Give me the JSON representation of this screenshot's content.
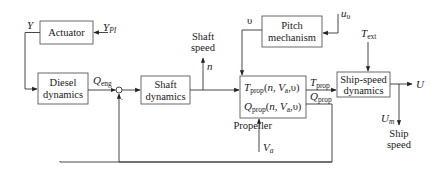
{
  "diagram": {
    "blocks": {
      "actuator": {
        "label": "Actuator"
      },
      "diesel": {
        "line1": "Diesel",
        "line2": "dynamics"
      },
      "shaft": {
        "line1": "Shaft",
        "line2": "dynamics"
      },
      "propeller": {
        "label": "Propeller",
        "thrust_fn": {
          "sym": "T",
          "sub": "prop",
          "args_pre": "(",
          "n": "n",
          "sep1": ", ",
          "va": "V",
          "va_sub": "a",
          "sep2": ",",
          "u": "υ",
          "close": ")"
        },
        "torque_fn": {
          "sym": "Q",
          "sub": "prop",
          "args_pre": "(",
          "n": "n",
          "sep1": ", ",
          "va": "V",
          "va_sub": "a",
          "sep2": ",",
          "u": "υ",
          "close": ")"
        }
      },
      "pitch": {
        "line1": "Pitch",
        "line2": "mechanism"
      },
      "ship_speed": {
        "line1": "Ship-speed",
        "line2": "dynamics"
      }
    },
    "signals": {
      "y": "Y",
      "y_pi": {
        "sym": "Y",
        "sub": "PI"
      },
      "q_eng": {
        "sym": "Q",
        "sub": "eng"
      },
      "sum_minus": "-",
      "shaft_speed": {
        "line1": "Shaft",
        "line2": "speed",
        "sym": "n"
      },
      "upsilon": "υ",
      "u_upsilon": {
        "sym": "u",
        "sub": "υ"
      },
      "t_ext": {
        "sym": "T",
        "sub": "ext"
      },
      "t_prop": {
        "sym": "T",
        "sub": "prop"
      },
      "q_prop": {
        "sym": "Q",
        "sub": "prop"
      },
      "v_a": {
        "sym": "V",
        "sub": "a"
      },
      "u_out": "U",
      "u_m": {
        "sym": "U",
        "sub": "m"
      },
      "ship_speed": {
        "line1": "Ship",
        "line2": "speed"
      }
    },
    "colors": {
      "line": "#333333",
      "box_border": "#5a5a5a",
      "text": "#1a1a1a",
      "background": "#ffffff"
    }
  }
}
